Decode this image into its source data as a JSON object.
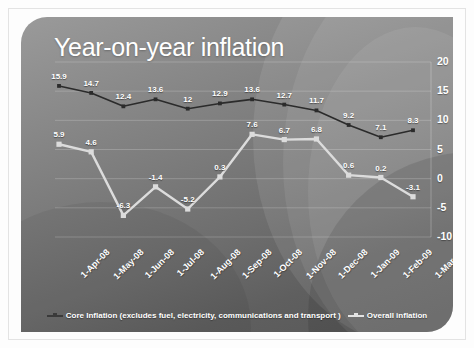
{
  "slide": {
    "title": "Year-on-year inflation"
  },
  "chart_data": {
    "type": "line",
    "title": "Year-on-year inflation",
    "xlabel": "",
    "ylabel": "",
    "ylim": [
      -10,
      20
    ],
    "yticks": [
      "-10",
      "-5",
      "0",
      "5",
      "10",
      "15",
      "20"
    ],
    "ytick_values": [
      -10,
      -5,
      0,
      5,
      10,
      15,
      20
    ],
    "y_axis_position": "right",
    "grid": true,
    "legend_position": "bottom",
    "categories": [
      "1-Apr-08",
      "1-May-08",
      "1-Jun-08",
      "1-Jul-08",
      "1-Aug-08",
      "1-Sep-08",
      "1-Oct-08",
      "1-Nov-08",
      "1-Dec-08",
      "1-Jan-09",
      "1-Feb-09",
      "1-Mar-09"
    ],
    "series": [
      {
        "name": "Core Inflation (excludes fuel, electricity, communications and transport )",
        "color": "#2b2b2b",
        "values": [
          15.9,
          14.7,
          12.4,
          13.6,
          12,
          12.9,
          13.6,
          12.7,
          11.7,
          9.2,
          7.1,
          8.3
        ],
        "labels": [
          "15.9",
          "14.7",
          "12.4",
          "13.6",
          "12",
          "12.9",
          "13.6",
          "12.7",
          "11.7",
          "9.2",
          "7.1",
          "8.3"
        ]
      },
      {
        "name": "Overall inflation",
        "color": "#dcdcdc",
        "values": [
          5.9,
          4.6,
          -6.3,
          -1.4,
          -5.2,
          0.3,
          7.6,
          6.7,
          6.8,
          0.6,
          0.2,
          -3.1
        ],
        "labels": [
          "5.9",
          "4.6",
          "-6.3",
          "-1.4",
          "-5.2",
          "0.3",
          "7.6",
          "6.7",
          "6.8",
          "0.6",
          "0.2",
          "-3.1"
        ]
      }
    ]
  },
  "legend": {
    "items": [
      {
        "label": "Core Inflation (excludes fuel, electricity, communications and transport )",
        "color": "#3a3a3a"
      },
      {
        "label": "Overall inflation",
        "color": "#e2e2e2"
      }
    ]
  }
}
